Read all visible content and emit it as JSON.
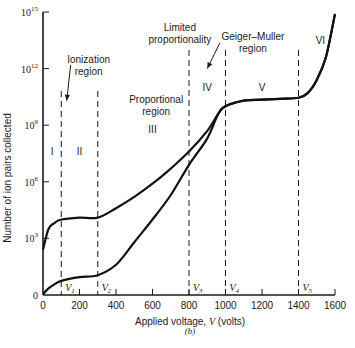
{
  "chart_data": {
    "type": "line",
    "title": "",
    "caption": "(b)",
    "xlabel": "Applied voltage, V (volts)",
    "xlabel_parts": {
      "prefix": "Applied voltage, ",
      "var": "V",
      "suffix": " (volts)"
    },
    "ylabel": "Number of ion pairs collected",
    "xlim": [
      0,
      1600
    ],
    "ylim_log10": [
      0,
      15
    ],
    "x_ticks": [
      0,
      200,
      400,
      600,
      800,
      1000,
      1200,
      1400,
      1600
    ],
    "x_tick_labels": [
      "0",
      "200",
      "400",
      "600",
      "800",
      "1000",
      "1200",
      "1400",
      "1600"
    ],
    "y_ticks_log10": [
      0,
      3,
      6,
      9,
      12,
      15
    ],
    "y_tick_labels": [
      {
        "base": "0",
        "exp": ""
      },
      {
        "base": "10",
        "exp": "3"
      },
      {
        "base": "10",
        "exp": "6"
      },
      {
        "base": "10",
        "exp": "9"
      },
      {
        "base": "10",
        "exp": "12"
      },
      {
        "base": "10",
        "exp": "15"
      }
    ],
    "grid": false,
    "legend": null,
    "voltage_markers": [
      {
        "name": "V1",
        "sub": "1",
        "x": 100
      },
      {
        "name": "V2",
        "sub": "2",
        "x": 300
      },
      {
        "name": "V3",
        "sub": "3",
        "x": 800
      },
      {
        "name": "V4",
        "sub": "4",
        "x": 1000
      },
      {
        "name": "V5",
        "sub": "5",
        "x": 1400
      }
    ],
    "regions": [
      {
        "label": "I",
        "x": 50,
        "y_log10": 7.4
      },
      {
        "label": "II",
        "x": 200,
        "y_log10": 7.4
      },
      {
        "label": "III",
        "x": 600,
        "y_log10": 8.6
      },
      {
        "label": "IV",
        "x": 900,
        "y_log10": 10.8
      },
      {
        "label": "V",
        "x": 1200,
        "y_log10": 10.8
      },
      {
        "label": "VI",
        "x": 1520,
        "y_log10": 13.3
      }
    ],
    "annotations": [
      {
        "text": [
          "Ionization",
          "region"
        ],
        "x": 250,
        "y_log10": 12.3,
        "arrow_to": {
          "x": 130,
          "y_log10": 10.3
        }
      },
      {
        "text": [
          "Proportional",
          "region"
        ],
        "x": 620,
        "y_log10": 10.2
      },
      {
        "text": [
          "Limited",
          "proportionality"
        ],
        "x": 750,
        "y_log10": 14.0,
        "arrow_to": {
          "x": 900,
          "y_log10": 12.0
        }
      },
      {
        "text": [
          "Geiger–Muller",
          "region"
        ],
        "x": 1150,
        "y_log10": 13.5
      }
    ],
    "series": [
      {
        "name": "alpha (high ionization)",
        "points": [
          [
            0,
            2.4
          ],
          [
            30,
            3.5
          ],
          [
            60,
            3.8
          ],
          [
            100,
            4.0
          ],
          [
            200,
            4.1
          ],
          [
            300,
            4.1
          ],
          [
            400,
            4.6
          ],
          [
            500,
            5.2
          ],
          [
            600,
            5.9
          ],
          [
            700,
            6.7
          ],
          [
            800,
            7.6
          ],
          [
            900,
            8.7
          ],
          [
            960,
            9.6
          ],
          [
            1000,
            10.0
          ],
          [
            1100,
            10.3
          ],
          [
            1200,
            10.35
          ],
          [
            1300,
            10.4
          ],
          [
            1400,
            10.45
          ],
          [
            1450,
            10.7
          ],
          [
            1500,
            11.4
          ],
          [
            1550,
            12.6
          ],
          [
            1600,
            14.9
          ]
        ]
      },
      {
        "name": "beta (low ionization)",
        "points": [
          [
            0,
            0.05
          ],
          [
            30,
            0.35
          ],
          [
            60,
            0.55
          ],
          [
            100,
            0.75
          ],
          [
            200,
            0.95
          ],
          [
            300,
            1.05
          ],
          [
            400,
            1.6
          ],
          [
            500,
            2.8
          ],
          [
            600,
            4.0
          ],
          [
            700,
            5.3
          ],
          [
            800,
            6.9
          ],
          [
            900,
            8.3
          ],
          [
            960,
            9.6
          ],
          [
            1000,
            10.0
          ],
          [
            1100,
            10.3
          ],
          [
            1200,
            10.35
          ],
          [
            1300,
            10.4
          ],
          [
            1400,
            10.45
          ],
          [
            1450,
            10.7
          ],
          [
            1500,
            11.4
          ],
          [
            1550,
            12.6
          ],
          [
            1600,
            14.9
          ]
        ]
      }
    ]
  }
}
